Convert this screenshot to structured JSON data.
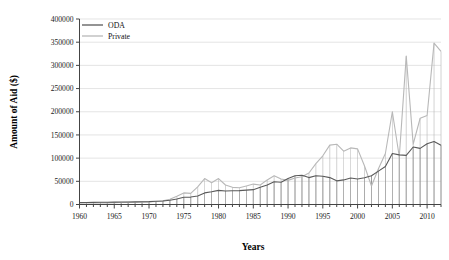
{
  "chart_data": {
    "type": "line",
    "title": "",
    "xlabel": "Years",
    "ylabel": "Amount of Aid ($)",
    "xlim": [
      1960,
      2012
    ],
    "ylim": [
      0,
      400000
    ],
    "ytick_step": 50000,
    "xtick_step": 5,
    "grid": true,
    "legend_position": "top-left",
    "x": [
      1960,
      1961,
      1962,
      1963,
      1964,
      1965,
      1966,
      1967,
      1968,
      1969,
      1970,
      1971,
      1972,
      1973,
      1974,
      1975,
      1976,
      1977,
      1978,
      1979,
      1980,
      1981,
      1982,
      1983,
      1984,
      1985,
      1986,
      1987,
      1988,
      1989,
      1990,
      1991,
      1992,
      1993,
      1994,
      1995,
      1996,
      1997,
      1998,
      1999,
      2000,
      2001,
      2002,
      2003,
      2004,
      2005,
      2006,
      2007,
      2008,
      2009,
      2010,
      2011,
      2012
    ],
    "ytick_labels": [
      "0",
      "50000",
      "100000",
      "150000",
      "200000",
      "250000",
      "300000",
      "350000",
      "400000"
    ],
    "xtick_labels": [
      "1960",
      "1965",
      "1970",
      "1975",
      "1980",
      "1985",
      "1990",
      "1995",
      "2000",
      "2005",
      "2010"
    ],
    "series": [
      {
        "name": "ODA",
        "color": "#5a5a5a",
        "values": [
          4200,
          4300,
          4500,
          4700,
          4900,
          5100,
          5300,
          5500,
          5700,
          6000,
          6300,
          7000,
          7600,
          9200,
          12000,
          15500,
          16000,
          18500,
          25000,
          27500,
          30500,
          29000,
          29500,
          30000,
          31000,
          32000,
          37000,
          42000,
          49000,
          48000,
          56000,
          62000,
          63000,
          58000,
          62000,
          61000,
          58000,
          51000,
          53000,
          57000,
          55000,
          57500,
          62000,
          72000,
          82000,
          110000,
          107000,
          106000,
          124000,
          121000,
          131000,
          136000,
          128000
        ]
      },
      {
        "name": "Private",
        "color": "#b8b8b8",
        "values": [
          3000,
          3200,
          3100,
          3400,
          3600,
          4000,
          4200,
          4500,
          4800,
          5200,
          5600,
          6500,
          7800,
          11500,
          18000,
          25000,
          24000,
          38000,
          56000,
          47000,
          56000,
          42000,
          37000,
          36000,
          40000,
          44000,
          42000,
          53000,
          62000,
          55000,
          52000,
          57000,
          60000,
          68000,
          88000,
          105000,
          128000,
          130000,
          115000,
          122000,
          120000,
          83000,
          40000,
          77000,
          110000,
          200000,
          103000,
          320000,
          130000,
          186000,
          192000,
          348000,
          330000
        ]
      }
    ],
    "legend": [
      {
        "label": "ODA",
        "color": "#5a5a5a"
      },
      {
        "label": "Private",
        "color": "#b8b8b8"
      }
    ]
  },
  "axes": {
    "y_axis_title": "Amount of Aid ($)",
    "x_axis_title": "Years"
  }
}
